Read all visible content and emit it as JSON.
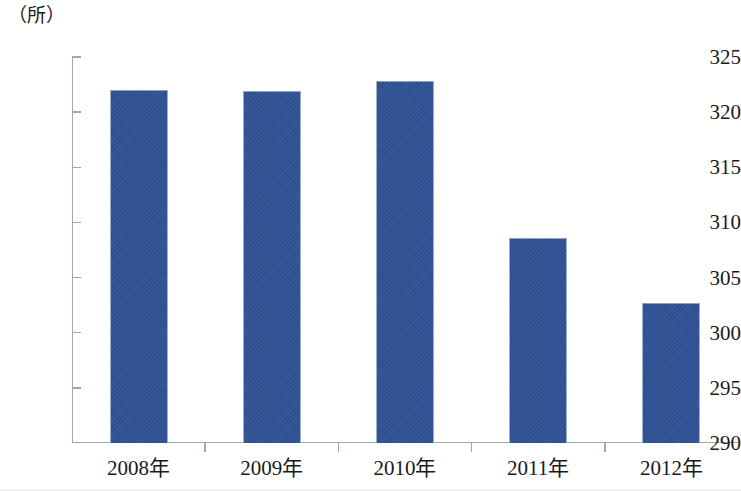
{
  "chart_data": {
    "type": "bar",
    "title": "",
    "xlabel": "",
    "ylabel": "（所）",
    "categories": [
      "2008年",
      "2009年",
      "2010年",
      "2011年",
      "2012年"
    ],
    "values": [
      322.0,
      321.9,
      322.8,
      308.6,
      302.7
    ],
    "ylim": [
      290,
      325
    ],
    "yticks": [
      290,
      295,
      300,
      305,
      310,
      315,
      320,
      325
    ],
    "ytick_labels": [
      "290",
      "295",
      "300",
      "305",
      "310",
      "315",
      "320",
      "325"
    ],
    "grid": false,
    "legend": "none",
    "series_color": "#2f5295",
    "axis_color": "#9aa9bf",
    "background": "#ffffff"
  }
}
